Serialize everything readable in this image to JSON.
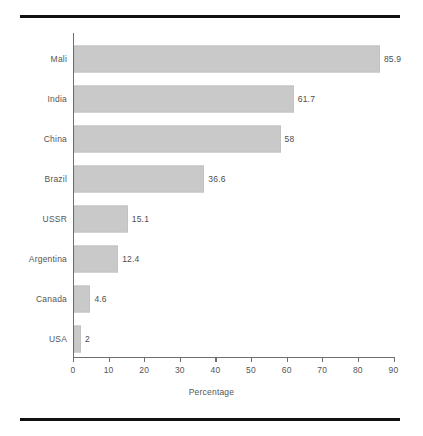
{
  "chart_data": {
    "type": "bar",
    "orientation": "horizontal",
    "title": "",
    "xlabel": "Percentage",
    "ylabel": "",
    "categories": [
      "Mali",
      "India",
      "China",
      "Brazil",
      "USSR",
      "Argentina",
      "Canada",
      "USA"
    ],
    "values": [
      85.9,
      61.7,
      58,
      36.6,
      15.1,
      12.4,
      4.6,
      2
    ],
    "value_labels": [
      "85.9",
      "61.7",
      "58",
      "36.6",
      "15.1",
      "12.4",
      "4.6",
      "2"
    ],
    "xlim": [
      0,
      90
    ],
    "xticks": [
      0,
      10,
      20,
      30,
      40,
      50,
      60,
      70,
      80,
      90
    ],
    "xtick_labels": [
      "0",
      "10",
      "20",
      "30",
      "40",
      "50",
      "60",
      "70",
      "80",
      "90"
    ],
    "grid": false,
    "legend": null,
    "bar_color": "#c9c9c9",
    "axis_color": "#6e6e6e",
    "text_color": "#555555",
    "rule_color": "#111111",
    "background": "#ffffff"
  }
}
